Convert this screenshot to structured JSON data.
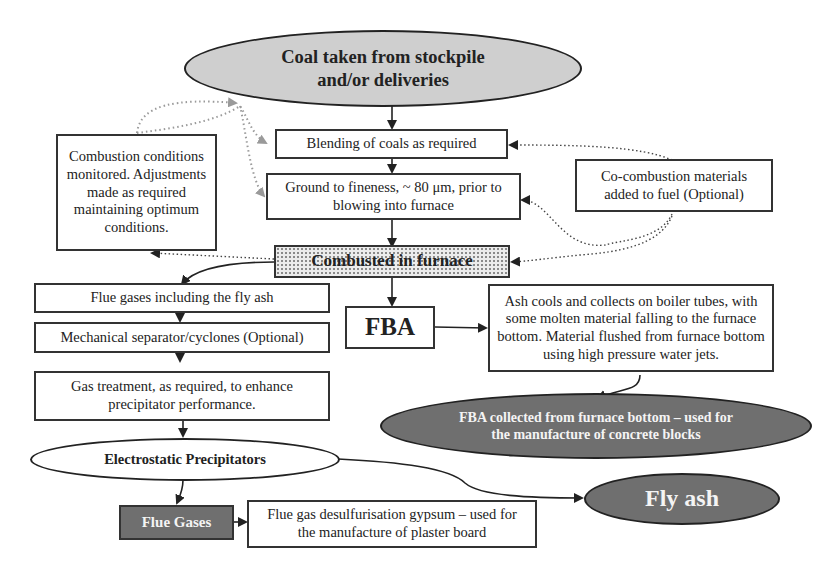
{
  "diagram": {
    "nodes": {
      "coal_source": "Coal taken from stockpile and/or deliveries",
      "blending": "Blending of coals as required",
      "grinding": "Ground to fineness, ~ 80 μm, prior to blowing into furnace",
      "monitoring": "Combustion conditions monitored. Adjustments made as required maintaining optimum conditions.",
      "cocombustion": "Co-combustion materials added to fuel (Optional)",
      "furnace": "Combusted in furnace",
      "flue_gases_fly_ash": "Flue gases including the fly ash",
      "cyclones": "Mechanical separator/cyclones (Optional)",
      "gas_treatment": "Gas treatment, as required, to enhance precipitator performance.",
      "esp": "Electrostatic Precipitators",
      "flue_gases": "Flue Gases",
      "fgd_gypsum": "Flue gas desulfurisation gypsum – used for the manufacture of plaster board",
      "fba": "FBA",
      "ash_cools": "Ash cools and collects on boiler tubes, with some molten material falling to the furnace bottom. Material flushed from furnace bottom using high pressure water jets.",
      "fba_collected": "FBA collected from furnace bottom – used for the manufacture of concrete blocks",
      "fly_ash": "Fly ash"
    },
    "edges": [
      {
        "from": "coal_source",
        "to": "blending",
        "style": "solid"
      },
      {
        "from": "blending",
        "to": "grinding",
        "style": "solid"
      },
      {
        "from": "grinding",
        "to": "furnace",
        "style": "solid"
      },
      {
        "from": "furnace",
        "to": "flue_gases_fly_ash",
        "style": "solid"
      },
      {
        "from": "flue_gases_fly_ash",
        "to": "cyclones",
        "style": "solid"
      },
      {
        "from": "cyclones",
        "to": "gas_treatment",
        "style": "solid"
      },
      {
        "from": "gas_treatment",
        "to": "esp",
        "style": "solid"
      },
      {
        "from": "esp",
        "to": "flue_gases",
        "style": "solid"
      },
      {
        "from": "flue_gases",
        "to": "fgd_gypsum",
        "style": "solid"
      },
      {
        "from": "esp",
        "to": "fly_ash",
        "style": "solid"
      },
      {
        "from": "furnace",
        "to": "fba",
        "style": "solid"
      },
      {
        "from": "fba",
        "to": "ash_cools",
        "style": "solid"
      },
      {
        "from": "ash_cools",
        "to": "fba_collected",
        "style": "solid"
      },
      {
        "from": "monitoring",
        "to": "coal_source",
        "style": "dotted-gray"
      },
      {
        "from": "monitoring",
        "to": "blending",
        "style": "dotted-gray"
      },
      {
        "from": "monitoring",
        "to": "grinding",
        "style": "dotted-gray"
      },
      {
        "from": "furnace",
        "to": "monitoring",
        "style": "dotted"
      },
      {
        "from": "cocombustion",
        "to": "blending",
        "style": "dotted"
      },
      {
        "from": "cocombustion",
        "to": "grinding",
        "style": "dotted"
      },
      {
        "from": "cocombustion",
        "to": "furnace",
        "style": "dotted"
      }
    ],
    "colors": {
      "line": "#222222",
      "dotted_gray": "#9a9a9a",
      "light_fill": "#cfcfcf",
      "dark_fill": "#6f6f6f"
    }
  }
}
